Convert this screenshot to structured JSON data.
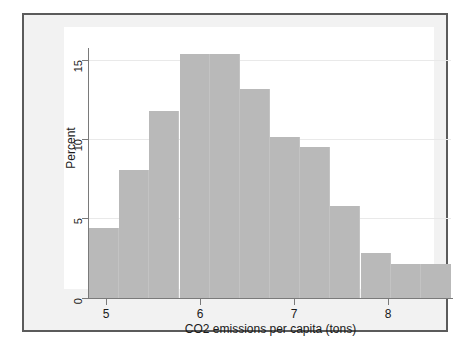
{
  "chart_data": {
    "type": "bar",
    "title": "",
    "subtitle": "",
    "xlabel": "CO2 emissions per capita (tons)",
    "ylabel": "Percent",
    "xlim": [
      4.8,
      8.4
    ],
    "ylim": [
      0,
      16.2
    ],
    "bin_width": 0.3,
    "grid": true,
    "legend": null,
    "xticks": [
      5,
      6,
      7,
      8
    ],
    "xtick_labels": [
      "5",
      "6",
      "7",
      "8"
    ],
    "yticks": [
      0,
      5,
      10,
      15
    ],
    "ytick_labels": [
      "0",
      "5",
      "10",
      "15"
    ],
    "bin_edges": [
      4.8,
      5.1,
      5.4,
      5.7,
      6.0,
      6.3,
      6.6,
      6.9,
      7.2,
      7.5,
      7.8,
      8.1,
      8.4
    ],
    "categories": [
      "4.8-5.1",
      "5.1-5.4",
      "5.4-5.7",
      "5.7-6.0",
      "6.0-6.3",
      "6.3-6.6",
      "6.6-6.9",
      "6.9-7.2",
      "7.2-7.5",
      "7.5-7.8",
      "7.8-8.1",
      "8.1-8.4"
    ],
    "values": [
      4.5,
      8.2,
      12.0,
      15.6,
      15.6,
      13.4,
      10.3,
      9.7,
      5.9,
      2.9,
      2.2,
      2.2
    ],
    "bar_color": "#b9b9b9",
    "plot_background": "#ffffff",
    "figure_background": "#f2f2f2",
    "frame_color": "#5b5b5b",
    "grid_color": "#e9e9e9",
    "axis_color": "#7a7a7a"
  }
}
